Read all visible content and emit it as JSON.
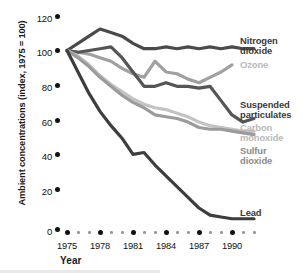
{
  "chart_data": {
    "type": "line",
    "title": "",
    "xlabel": "Year",
    "ylabel": "Ambient concentrations (index, 1975 = 100)",
    "xlim": [
      1975,
      1992
    ],
    "ylim": [
      0,
      125
    ],
    "yticks": [
      0,
      20,
      40,
      60,
      80,
      100,
      120
    ],
    "xticks": [
      1975,
      1978,
      1981,
      1984,
      1987,
      1990
    ],
    "x": [
      1975,
      1976,
      1977,
      1978,
      1979,
      1980,
      1981,
      1982,
      1983,
      1984,
      1985,
      1986,
      1987,
      1988,
      1989,
      1990,
      1991,
      1992
    ],
    "grid": false,
    "legend_position": "right",
    "series": [
      {
        "name": "Nitrogen dioxide",
        "color": "#4a4a4a",
        "values": [
          100,
          104,
          108,
          112,
          110,
          108,
          104,
          101,
          101,
          102,
          101,
          102,
          101,
          102,
          101,
          102,
          101,
          101
        ]
      },
      {
        "name": "Ozone",
        "color": "#a0a0a0",
        "values": [
          100,
          99,
          98,
          96,
          94,
          90,
          87,
          85,
          94,
          88,
          87,
          84,
          82,
          85,
          88,
          92,
          null,
          null
        ]
      },
      {
        "name": "Suspended particulates",
        "color": "#555555",
        "values": [
          100,
          99,
          100,
          101,
          102,
          96,
          88,
          80,
          80,
          82,
          80,
          80,
          79,
          80,
          72,
          64,
          60,
          62
        ]
      },
      {
        "name": "Carbon monoxide",
        "color": "#c3c3c3",
        "values": [
          100,
          97,
          92,
          86,
          81,
          77,
          73,
          70,
          68,
          67,
          65,
          63,
          60,
          58,
          57,
          56,
          55,
          55
        ]
      },
      {
        "name": "Sulfur dioxide",
        "color": "#9b9b9b",
        "values": [
          100,
          96,
          91,
          85,
          80,
          75,
          71,
          68,
          64,
          63,
          62,
          60,
          57,
          56,
          56,
          55,
          54,
          53
        ]
      },
      {
        "name": "Lead",
        "color": "#3d3d3d",
        "values": [
          100,
          88,
          76,
          66,
          58,
          51,
          42,
          43,
          36,
          30,
          24,
          18,
          12,
          8,
          7,
          6,
          6,
          6
        ]
      }
    ]
  },
  "axis": {
    "y_title": "Ambient concentrations (index, 1975 = 100)",
    "x_title": "Year",
    "y_tick_labels": [
      "120",
      "100",
      "80",
      "60",
      "40",
      "20",
      "0"
    ],
    "x_tick_labels": [
      "1975",
      "1978",
      "1981",
      "1984",
      "1987",
      "1990"
    ]
  },
  "legend": {
    "nitrogen_dioxide": "Nitrogen\ndioxide",
    "ozone": "Ozone",
    "suspended_particulates": "Suspended\nparticulates",
    "carbon_monoxide": "Carbon\nmonoxide",
    "sulfur_dioxide": "Sulfur\ndioxide",
    "lead": "Lead"
  },
  "colors": {
    "nitrogen_dioxide": "#4a4a4a",
    "ozone": "#a0a0a0",
    "suspended_particulates": "#555555",
    "carbon_monoxide": "#c3c3c3",
    "sulfur_dioxide": "#9b9b9b",
    "lead": "#3d3d3d",
    "axis": "#111111",
    "background": "#ffffff"
  }
}
